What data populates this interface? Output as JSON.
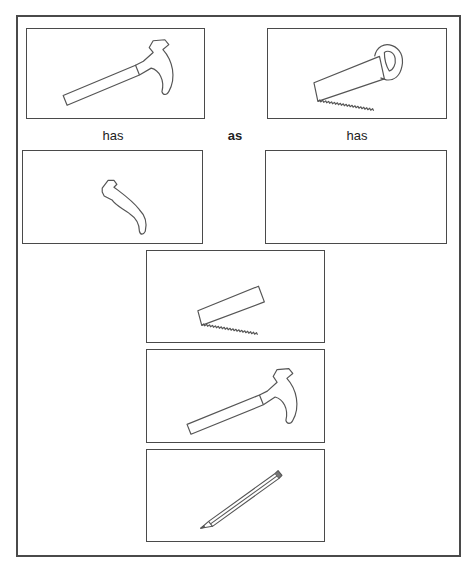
{
  "puzzle": {
    "type": "visual-analogy",
    "row1": {
      "left": {
        "image": "hammer-icon"
      },
      "right": {
        "image": "saw-icon"
      }
    },
    "connectors": {
      "left_label": "has",
      "middle_label": "as",
      "right_label": "has"
    },
    "row2": {
      "left": {
        "image": "hammer-claw-head-icon"
      },
      "right": {
        "image": "empty-answer-slot"
      }
    },
    "options": [
      {
        "image": "saw-blade-icon"
      },
      {
        "image": "hammer-icon"
      },
      {
        "image": "pencil-icon"
      }
    ],
    "colors": {
      "stroke": "#4a4a4a",
      "background": "#ffffff"
    }
  }
}
